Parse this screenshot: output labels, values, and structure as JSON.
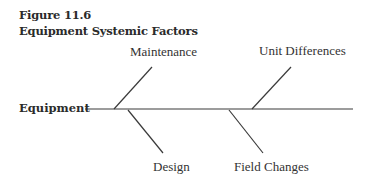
{
  "figure": {
    "number": "Figure 11.6",
    "title": "Equipment Systemic Factors"
  },
  "diagram": {
    "type": "fishbone",
    "effect": "Equipment",
    "causes_top": [
      "Maintenance",
      "Unit Differences"
    ],
    "causes_bottom": [
      "Design",
      "Field Changes"
    ]
  }
}
